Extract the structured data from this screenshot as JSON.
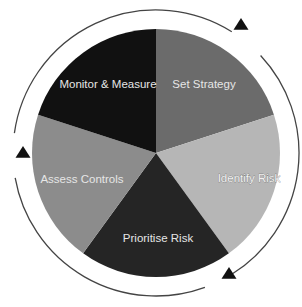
{
  "diagram": {
    "center": [
      156,
      153
    ],
    "radius": 124,
    "ring_radius": 143,
    "ring_color": "#444444",
    "arrow_color": "#111111",
    "slices": [
      {
        "id": "set-strategy",
        "label": "Set Strategy",
        "start_deg": 0,
        "end_deg": 72,
        "color": "#6b6b6b",
        "text_color": "#e8e8e8",
        "label_pos": [
          204,
          88
        ]
      },
      {
        "id": "identify-risk",
        "label": "Identify Risk",
        "start_deg": 72,
        "end_deg": 144,
        "color": "#b6b6b6",
        "text_color": "#f4f4f4",
        "label_pos": [
          249,
          182
        ]
      },
      {
        "id": "prioritise-risk",
        "label": "Prioritise Risk",
        "start_deg": 144,
        "end_deg": 216,
        "color": "#252525",
        "text_color": "#e8e8e8",
        "label_pos": [
          158,
          242
        ]
      },
      {
        "id": "assess-controls",
        "label": "Assess Controls",
        "start_deg": 216,
        "end_deg": 288,
        "color": "#8c8c8c",
        "text_color": "#eeeeee",
        "label_pos": [
          82,
          183
        ]
      },
      {
        "id": "monitor-measure",
        "label": "Monitor & Measure",
        "start_deg": 288,
        "end_deg": 360,
        "color": "#111111",
        "text_color": "#e4e4e4",
        "label_pos": [
          108,
          88
        ]
      }
    ],
    "ring_arcs": [
      {
        "start_deg": 278,
        "end_deg": 32
      },
      {
        "start_deg": 47,
        "end_deg": 148
      },
      {
        "start_deg": 160,
        "end_deg": 260
      }
    ],
    "arrows": [
      {
        "id": "arrow-to-set-strategy",
        "tip": [
          241,
          18
        ],
        "size": 13,
        "direction": "up"
      },
      {
        "id": "arrow-to-prioritise-risk",
        "tip": [
          229,
          267
        ],
        "size": 13,
        "direction": "up"
      },
      {
        "id": "arrow-to-monitor-measure",
        "tip": [
          23,
          146
        ],
        "size": 13,
        "direction": "up"
      }
    ]
  }
}
